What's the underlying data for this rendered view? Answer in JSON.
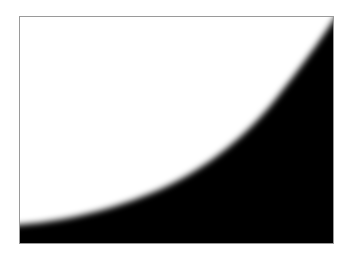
{
  "image": {
    "description": "Framed grayscale image: white region upper-left separated from black region lower-right by a soft-edged concave curve",
    "colors": {
      "background": "#ffffff",
      "frame_border": "#9a9a9a",
      "light_region": "#ffffff",
      "dark_region": "#000000"
    },
    "frame": {
      "x": 19,
      "y": 16,
      "width": 315,
      "height": 228
    },
    "edge_softness_px": 10,
    "curve_points": [
      [
        0,
        212
      ],
      [
        41,
        206
      ],
      [
        81,
        196
      ],
      [
        141,
        174
      ],
      [
        181,
        149
      ],
      [
        221,
        119
      ],
      [
        251,
        89
      ],
      [
        281,
        52
      ],
      [
        315,
        2
      ]
    ]
  }
}
